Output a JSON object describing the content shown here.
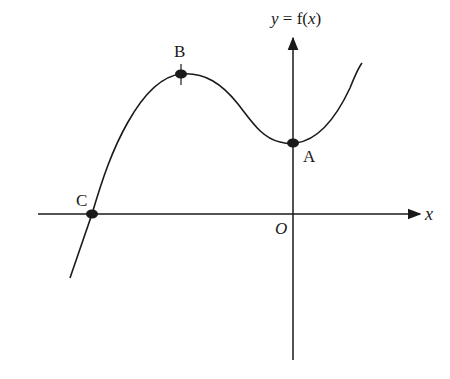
{
  "figure": {
    "title": "y = f(x)",
    "title_parts": {
      "y": "y",
      "eq": " = f(",
      "x": "x",
      "close": ")"
    },
    "x_axis_label": "x",
    "origin_label": "O",
    "points": [
      {
        "name": "A",
        "label": "A",
        "description": "y-intercept, local minimum region"
      },
      {
        "name": "B",
        "label": "B",
        "description": "local maximum (turning point)"
      },
      {
        "name": "C",
        "label": "C",
        "description": "x-intercept (root)"
      }
    ],
    "colors": {
      "ink": "#1a1a1a",
      "background": "#ffffff"
    }
  }
}
